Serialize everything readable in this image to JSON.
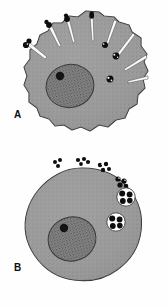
{
  "figure": {
    "background_color": "#fefefe",
    "width": 168,
    "height": 307
  },
  "palette": {
    "cytoplasm": "#9a9a9a",
    "cytoplasm_shade": "#8d8d8d",
    "cell_outline": "#2a2a2a",
    "nucleus_fill": "#7d7d7d",
    "nucleus_stipple": "#3a3a3a",
    "nucleolus": "#141414",
    "bacterium": "#0d0d0d",
    "vacuole_fill": "#fdfdfd",
    "cleft_fill": "#fbfbfb",
    "label_color": "#0d0d0d"
  },
  "panels": [
    {
      "id": "panel-a",
      "label": "A",
      "name": "phagocyte-extending-pseudopods",
      "cell": {
        "name": "phagocyte-cell-a",
        "shape": "irregular-lobed-circle",
        "center_x": 86,
        "center_y": 73,
        "radius": 62
      },
      "nucleus": {
        "name": "nucleus-a",
        "center_x": 70,
        "center_y": 86,
        "rx": 24,
        "ry": 21,
        "stippled": true,
        "nucleolus": {
          "center_x": 60,
          "center_y": 76,
          "r": 4
        }
      },
      "pseudopods": [
        {
          "angle_deg": 182,
          "bacterium": true
        },
        {
          "angle_deg": 158,
          "bacterium": true
        },
        {
          "angle_deg": 128,
          "bacterium": true
        },
        {
          "angle_deg": 100,
          "bacterium": true
        },
        {
          "angle_deg": 72,
          "bacterium": true
        },
        {
          "angle_deg": 48,
          "bacterium": true
        },
        {
          "angle_deg": 24,
          "bacterium": true
        },
        {
          "angle_deg": 2,
          "bacterium": false
        }
      ],
      "bacteria_count": 7,
      "vacuole_count": 0
    },
    {
      "id": "panel-b",
      "label": "B",
      "name": "phagocyte-with-internalized-bacteria",
      "cell": {
        "name": "phagocyte-cell-b",
        "shape": "round-cell",
        "center_x": 82,
        "center_y": 228,
        "radius": 60
      },
      "nucleus": {
        "name": "nucleus-b",
        "center_x": 72,
        "center_y": 239,
        "rx": 24,
        "ry": 22,
        "stippled": true,
        "nucleolus": {
          "center_x": 64,
          "center_y": 228,
          "r": 4
        }
      },
      "surface_bacteria_clusters": [
        {
          "x": 57,
          "y": 163,
          "count": 3
        },
        {
          "x": 80,
          "y": 159,
          "count": 3
        },
        {
          "x": 100,
          "y": 164,
          "count": 3
        },
        {
          "x": 115,
          "y": 176,
          "count": 3
        }
      ],
      "vacuoles": [
        {
          "name": "phagosome-1",
          "x": 126,
          "y": 197,
          "r": 9,
          "bacteria": 4
        },
        {
          "name": "phagosome-2",
          "x": 116,
          "y": 222,
          "r": 9,
          "bacteria": 4
        }
      ],
      "bacteria_count": 20,
      "vacuole_count": 2
    }
  ]
}
